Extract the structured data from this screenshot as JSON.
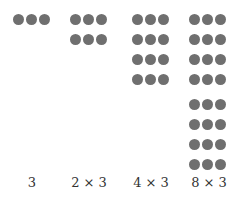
{
  "groups": [
    {
      "label": "3",
      "rows": 1,
      "cols": 3,
      "left": 13,
      "center": 32
    },
    {
      "label": "2 × 3",
      "rows": 2,
      "cols": 3,
      "left": 70,
      "center": 89
    },
    {
      "label": "4 × 3",
      "rows": 4,
      "cols": 3,
      "left": 132,
      "center": 151
    },
    {
      "label": "8 × 3",
      "rows": 8,
      "cols": 3,
      "left": 189,
      "center": 209
    }
  ],
  "colors": {
    "dot": "#6f6f6f",
    "text": "#333333"
  }
}
